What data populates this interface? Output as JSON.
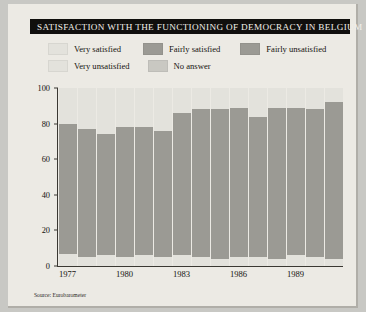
{
  "header": {
    "title": "SATISFACTION WITH THE FUNCTIONING OF DEMOCRACY IN BELGIUM"
  },
  "source_note": "Source: Eurobarometer",
  "colors": {
    "very_satisfied": "#e3e2dc",
    "fairly_satisfied": "#9b9a94",
    "fairly_unsatisfied": "#9b9a94",
    "very_unsatisfied": "#e3e2dc",
    "no_answer": "#c9c8c2",
    "title_bar": "#100f0d",
    "title_text": "#f2f0ea",
    "page_background": "#eceae4",
    "axis": "#3a3832"
  },
  "legend": {
    "row1": [
      {
        "label": "Very satisfied",
        "color_key": "very_satisfied"
      },
      {
        "label": "Fairly satisfied",
        "color_key": "fairly_satisfied"
      },
      {
        "label": "Fairly unsatisfied",
        "color_key": "fairly_unsatisfied"
      }
    ],
    "row2": [
      {
        "label": "Very unsatisfied",
        "color_key": "very_unsatisfied"
      },
      {
        "label": "No answer",
        "color_key": "no_answer"
      }
    ]
  },
  "chart_data": {
    "type": "bar",
    "stacked": true,
    "title": "SATISFACTION WITH THE FUNCTIONING OF DEMOCRACY IN BELGIUM",
    "xlabel": "",
    "ylabel": "",
    "ylim": [
      0,
      100
    ],
    "yticks": [
      0,
      20,
      40,
      60,
      80,
      100
    ],
    "grid": false,
    "legend_position": "top",
    "categories": [
      "1977",
      "1978",
      "1979",
      "1980",
      "1981",
      "1982",
      "1983",
      "1984",
      "1985",
      "1986",
      "1987",
      "1988",
      "1989",
      "1990",
      "1991"
    ],
    "xtick_labels": [
      "1977",
      "1980",
      "1983",
      "1986",
      "1989"
    ],
    "xtick_categories": [
      "1977",
      "1980",
      "1983",
      "1986",
      "1989"
    ],
    "series": [
      {
        "name": "Very satisfied",
        "color_key": "very_satisfied",
        "values": [
          7,
          5,
          6,
          5,
          6,
          5,
          6,
          5,
          4,
          5,
          5,
          4,
          6,
          5,
          4
        ]
      },
      {
        "name": "Fairly satisfied",
        "color_key": "fairly_satisfied",
        "values": [
          60,
          53,
          56,
          51,
          51,
          58,
          66,
          66,
          68,
          68,
          58,
          74,
          73,
          66,
          80
        ]
      },
      {
        "name": "Fairly unsatisfied",
        "color_key": "fairly_unsatisfied",
        "values": [
          13,
          19,
          12,
          22,
          21,
          13,
          14,
          17,
          16,
          16,
          21,
          11,
          10,
          17,
          8
        ]
      },
      {
        "name": "Very unsatisfied",
        "color_key": "very_unsatisfied",
        "values": [
          20,
          23,
          26,
          22,
          22,
          24,
          14,
          12,
          12,
          11,
          16,
          11,
          11,
          12,
          8
        ]
      }
    ]
  }
}
